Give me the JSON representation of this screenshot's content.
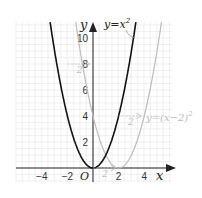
{
  "diagram": {
    "curves": [
      {
        "name": "y=x²",
        "label": "y=x",
        "superscript": "2",
        "color": "#111111",
        "shift": 0
      },
      {
        "name": "y=(x−2)²",
        "label": "y=(x−2)",
        "superscript": "2",
        "color": "#bbbbbb",
        "shift": 2
      }
    ],
    "axes": {
      "x_label": "x",
      "y_label": "y",
      "origin_label": "O",
      "x_ticks": [
        "−4",
        "−2",
        "2",
        "4"
      ],
      "x_tick_values": [
        -4,
        -2,
        2,
        4
      ],
      "y_ticks": [
        "2",
        "4",
        "6",
        "8",
        "10"
      ],
      "y_tick_values": [
        2,
        4,
        6,
        8,
        10
      ]
    },
    "shift_annotations": [
      {
        "label": "2",
        "from": [
          -2,
          8
        ],
        "to": [
          0,
          8
        ]
      },
      {
        "label": "2",
        "from": [
          2,
          4
        ],
        "to": [
          4,
          4
        ]
      },
      {
        "label": "2",
        "from": [
          0,
          0
        ],
        "to": [
          2,
          0
        ]
      }
    ],
    "colors": {
      "grid": "#e6e6e6",
      "axis": "#222222",
      "base_curve": "#111111",
      "shifted_curve": "#bbbbbb",
      "annotation": "#bbbbbb"
    }
  }
}
